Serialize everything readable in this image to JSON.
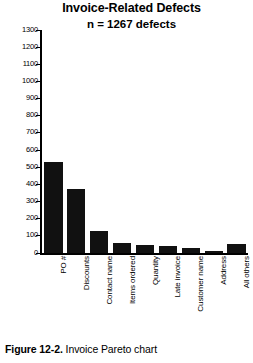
{
  "chart_data": {
    "type": "bar",
    "title": "Invoice-Related Defects",
    "subtitle": "n = 1267 defects",
    "xlabel": "",
    "ylabel": "",
    "ylim": [
      0,
      1300
    ],
    "ytick_step": 100,
    "yticks": [
      0,
      100,
      200,
      300,
      400,
      500,
      600,
      700,
      800,
      900,
      1000,
      1100,
      1200,
      1300
    ],
    "grid": false,
    "legend": false,
    "bar_color": "#111111",
    "categories": [
      "PO #",
      "Discounts",
      "Contact name",
      "Items ordered",
      "Quantity",
      "Late invoice",
      "Customer name",
      "Address",
      "All others"
    ],
    "values": [
      530,
      375,
      130,
      60,
      45,
      40,
      28,
      12,
      55
    ]
  },
  "caption": {
    "label": "Figure 12-2.",
    "text": "Invoice Pareto chart"
  }
}
